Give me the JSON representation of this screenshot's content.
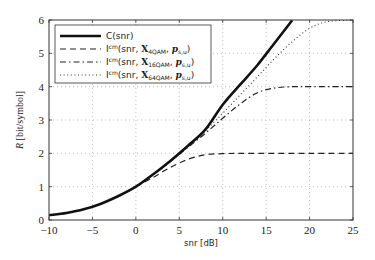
{
  "chart_data": {
    "type": "line",
    "title": "",
    "xlabel": "snr [dB]",
    "ylabel": "R [bit/symbol]",
    "xlim": [
      -10,
      25
    ],
    "ylim": [
      0,
      6
    ],
    "xticks": [
      -10,
      -5,
      0,
      5,
      10,
      15,
      20,
      25
    ],
    "yticks": [
      0,
      1,
      2,
      3,
      4,
      5,
      6
    ],
    "xtick_labels": [
      "−10",
      "−5",
      "0",
      "5",
      "10",
      "15",
      "20",
      "25"
    ],
    "ytick_labels": [
      "0",
      "1",
      "2",
      "3",
      "4",
      "5",
      "6"
    ],
    "grid": true,
    "legend_position": "upper left",
    "series": [
      {
        "name": "C(snr)",
        "legend": {
          "base": "C(snr)"
        },
        "style": "solid",
        "x": [
          -10,
          -8,
          -6,
          -4,
          -2,
          0,
          2,
          4,
          6,
          8,
          10,
          12,
          14,
          16,
          18
        ],
        "y": [
          0.14,
          0.21,
          0.32,
          0.49,
          0.72,
          1.0,
          1.37,
          1.78,
          2.23,
          2.71,
          3.46,
          4.06,
          4.65,
          5.32,
          5.99
        ]
      },
      {
        "name": "Icm(snr, X4QAM, ps,u)",
        "legend": {
          "base": "I",
          "sup": "cm",
          "arg1": "snr, ",
          "X": "X",
          "Xsub": "4QAM",
          "p": "p",
          "psub": "s,u"
        },
        "style": "dashed",
        "x": [
          0,
          2,
          4,
          6,
          8,
          10,
          12,
          15,
          20,
          25
        ],
        "y": [
          1.0,
          1.28,
          1.58,
          1.82,
          1.96,
          1.99,
          2.0,
          2.0,
          2.0,
          2.0
        ]
      },
      {
        "name": "Icm(snr, X16QAM, ps,u)",
        "legend": {
          "base": "I",
          "sup": "cm",
          "arg1": "snr, ",
          "X": "X",
          "Xsub": "16QAM",
          "p": "p",
          "psub": "s,u"
        },
        "style": "dashdot",
        "x": [
          0,
          2,
          4,
          6,
          8,
          10,
          12,
          14,
          16,
          18,
          20,
          25
        ],
        "y": [
          1.0,
          1.36,
          1.76,
          2.18,
          2.6,
          3.05,
          3.48,
          3.82,
          3.96,
          4.0,
          4.0,
          4.0
        ]
      },
      {
        "name": "Icm(snr, X64QAM, ps,u)",
        "legend": {
          "base": "I",
          "sup": "cm",
          "arg1": "snr, ",
          "X": "X",
          "Xsub": "64QAM",
          "p": "p",
          "psub": "s,u"
        },
        "style": "dotted",
        "x": [
          0,
          2,
          4,
          6,
          8,
          10,
          12,
          14,
          16,
          18,
          20,
          22,
          25
        ],
        "y": [
          1.0,
          1.37,
          1.78,
          2.22,
          2.68,
          3.2,
          3.75,
          4.3,
          4.85,
          5.35,
          5.75,
          5.95,
          6.0
        ]
      }
    ]
  }
}
